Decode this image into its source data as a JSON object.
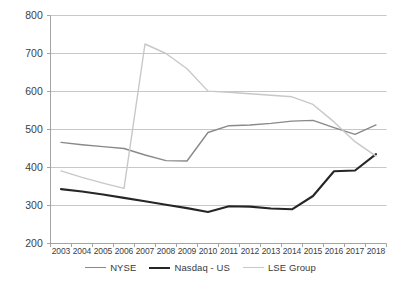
{
  "chart_data": {
    "type": "line",
    "title": "",
    "subtitle": "",
    "xlabel": "",
    "ylabel": "",
    "categories": [
      "2003",
      "2004",
      "2005",
      "2006",
      "2007",
      "2008",
      "2009",
      "2010",
      "2011",
      "2012",
      "2013",
      "2014",
      "2015",
      "2016",
      "2017",
      "2018"
    ],
    "x_tick_labels": [
      "2003",
      "2004",
      "2005",
      "2006",
      "2007",
      "2008",
      "2009",
      "2010",
      "2011",
      "2012",
      "2013",
      "2014",
      "2015",
      "2016",
      "2017",
      "2018"
    ],
    "y_tick_labels": [
      "200",
      "300",
      "400",
      "500",
      "600",
      "700",
      "800"
    ],
    "y_ticks": [
      200,
      300,
      400,
      500,
      600,
      700,
      800
    ],
    "ylim": [
      200,
      800
    ],
    "grid": "horizontal",
    "legend_position": "bottom",
    "series": [
      {
        "name": "NYSE",
        "color": "#898989",
        "width": 1.4,
        "values": [
          466,
          460,
          455,
          450,
          433,
          418,
          417,
          492,
          510,
          512,
          516,
          522,
          524,
          505,
          487,
          512
        ]
      },
      {
        "name": "Nasdaq - US",
        "color": "#262626",
        "width": 2.1,
        "values": [
          343,
          337,
          329,
          320,
          311,
          302,
          293,
          283,
          298,
          297,
          292,
          290,
          325,
          355,
          389,
          390
        ]
      },
      {
        "name": "LSE Group",
        "color": "#c8c8c8",
        "width": 1.4,
        "values": [
          391,
          374,
          359,
          345,
          725,
          700,
          660,
          601,
          598,
          594,
          590,
          586,
          566,
          520,
          468,
          430
        ]
      }
    ],
    "series_overrides": {
      "Nasdaq - US": [
        343,
        337,
        329,
        320,
        311,
        302,
        293,
        283,
        298,
        297,
        292,
        290,
        325,
        390,
        392,
        435
      ],
      "NYSE": [
        466,
        460,
        455,
        450,
        433,
        418,
        417,
        492,
        510,
        512,
        516,
        522,
        524,
        505,
        487,
        512
      ],
      "LSE Group": [
        391,
        374,
        359,
        345,
        725,
        700,
        660,
        601,
        598,
        594,
        590,
        586,
        566,
        520,
        468,
        430
      ]
    }
  },
  "legend": {
    "items": [
      {
        "label": "NYSE"
      },
      {
        "label": "Nasdaq - US"
      },
      {
        "label": "LSE Group"
      }
    ]
  },
  "colors": {
    "nyse": "#898989",
    "nasdaq": "#262626",
    "lse": "#c8c8c8",
    "grid": "#b9b9b9",
    "axis": "#9a9a9a",
    "text": "#404040",
    "background": "#ffffff"
  }
}
